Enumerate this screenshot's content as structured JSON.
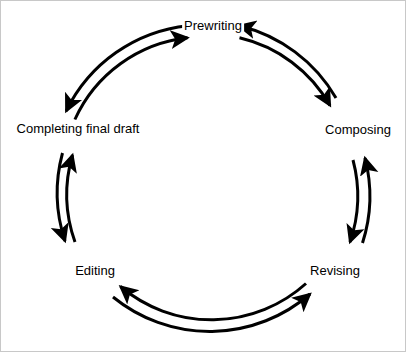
{
  "diagram": {
    "type": "circular-cycle",
    "background_color": "#ffffff",
    "stroke_color": "#000000",
    "text_color": "#000000",
    "stroke_width": 3,
    "center": {
      "x": 212,
      "y": 176
    },
    "outer_radius": 153,
    "inner_radius": 141,
    "nodes": [
      {
        "id": "prewriting",
        "label": "Prewriting",
        "angle_deg": -90,
        "x": 212,
        "y": 24
      },
      {
        "id": "composing",
        "label": "Composing",
        "angle_deg": -18,
        "x": 357,
        "y": 128
      },
      {
        "id": "revising",
        "label": "Revising",
        "angle_deg": 54,
        "x": 334,
        "y": 269
      },
      {
        "id": "editing",
        "label": "Editing",
        "angle_deg": 126,
        "x": 94,
        "y": 269
      },
      {
        "id": "completing-final-draft",
        "label": "Completing final draft",
        "angle_deg": 198,
        "x": 77,
        "y": 127
      }
    ],
    "connections": [
      {
        "from": "completing-final-draft",
        "to": "prewriting",
        "bidirectional": true
      },
      {
        "from": "prewriting",
        "to": "composing",
        "bidirectional": true
      },
      {
        "from": "composing",
        "to": "revising",
        "bidirectional": true
      },
      {
        "from": "revising",
        "to": "editing",
        "bidirectional": true
      },
      {
        "from": "editing",
        "to": "completing-final-draft",
        "bidirectional": true
      }
    ]
  }
}
